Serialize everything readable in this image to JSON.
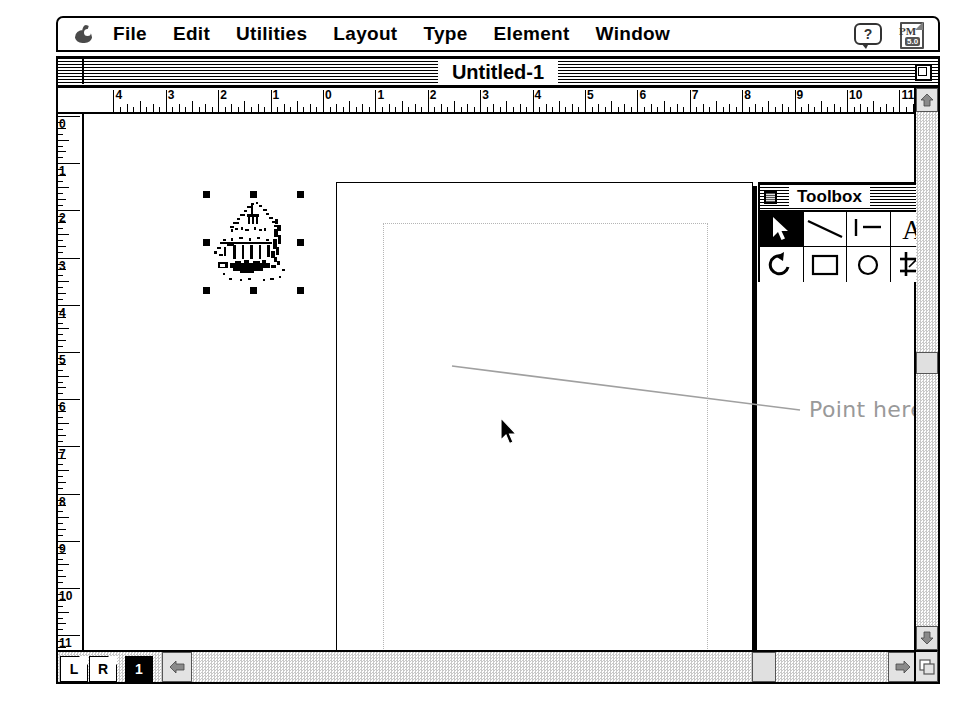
{
  "app": {
    "name": "Adobe PageMaker",
    "version": "5.0",
    "apple_icon": "apple-logo-icon",
    "help_icon": "help-balloon-icon",
    "help_label": "?",
    "app_badge_label": "PM",
    "app_badge_version": "5.0"
  },
  "menubar": {
    "items": [
      {
        "label": "File"
      },
      {
        "label": "Edit"
      },
      {
        "label": "Utilities"
      },
      {
        "label": "Layout"
      },
      {
        "label": "Type"
      },
      {
        "label": "Element"
      },
      {
        "label": "Window"
      }
    ]
  },
  "window": {
    "title": "Untitled-1",
    "close_box": "close-box",
    "zoom_box": "zoom-box"
  },
  "rulers": {
    "unit": "inches",
    "horizontal_labels": [
      "4",
      "3",
      "2",
      "1",
      "0",
      "1",
      "2",
      "3",
      "4",
      "5",
      "6",
      "7",
      "8",
      "9",
      "10",
      "11",
      "12",
      "13"
    ],
    "vertical_labels": [
      "0",
      "1",
      "2",
      "3",
      "4",
      "5",
      "6",
      "7",
      "8",
      "9",
      "10",
      "11"
    ]
  },
  "toolbox": {
    "title": "Toolbox",
    "close_box": "toolbox-close-box",
    "tools": [
      {
        "name": "pointer-tool",
        "label": "Pointer",
        "selected": true
      },
      {
        "name": "diagonal-line-tool",
        "label": "Diagonal line",
        "selected": false
      },
      {
        "name": "perpendicular-line-tool",
        "label": "Perpendicular line",
        "selected": false
      },
      {
        "name": "text-tool",
        "label": "Text",
        "selected": false
      },
      {
        "name": "rotate-tool",
        "label": "Rotate",
        "selected": false
      },
      {
        "name": "rectangle-tool",
        "label": "Rectangle",
        "selected": false
      },
      {
        "name": "ellipse-tool",
        "label": "Ellipse",
        "selected": false
      },
      {
        "name": "crop-tool",
        "label": "Cropping",
        "selected": false
      }
    ]
  },
  "canvas": {
    "selected_object": "placed-bitmap-graphic",
    "selection_handle_count": 8,
    "cursor": "arrow-pointer-cursor"
  },
  "annotation": {
    "callout_text": "Point here",
    "callout_color": "#999999"
  },
  "pagebar": {
    "master_left": "L",
    "master_right": "R",
    "pages": [
      {
        "label": "1",
        "active": true
      }
    ]
  },
  "scrollbars": {
    "up_arrow": "scroll-up-icon",
    "down_arrow": "scroll-down-icon",
    "left_arrow": "scroll-left-icon",
    "right_arrow": "scroll-right-icon",
    "grow_box": "window-resize-grow-box"
  }
}
